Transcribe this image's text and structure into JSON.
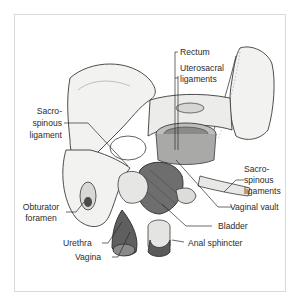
{
  "figure": {
    "labels": {
      "rectum": "Rectum",
      "uterosacral_1": "Uterosacral",
      "uterosacral_2": "ligaments",
      "sacrospinous_left_1": "Sacro-",
      "sacrospinous_left_2": "spinous",
      "sacrospinous_left_3": "ligament",
      "sacrospinous_right_1": "Sacro-",
      "sacrospinous_right_2": "spinous",
      "sacrospinous_right_3": "ligaments",
      "obturator_1": "Obturator",
      "obturator_2": "foramen",
      "vaginal_vault": "Vaginal vault",
      "bladder": "Bladder",
      "urethra": "Urethra",
      "vagina": "Vagina",
      "anal_sphincter": "Anal sphincter"
    },
    "colors": {
      "frame_border": "#d9d9d9",
      "bone_fill": "#f2f2f0",
      "outline": "#3a3a3a",
      "muscle": "#6e6e6e",
      "text": "#2b2b2b"
    }
  }
}
